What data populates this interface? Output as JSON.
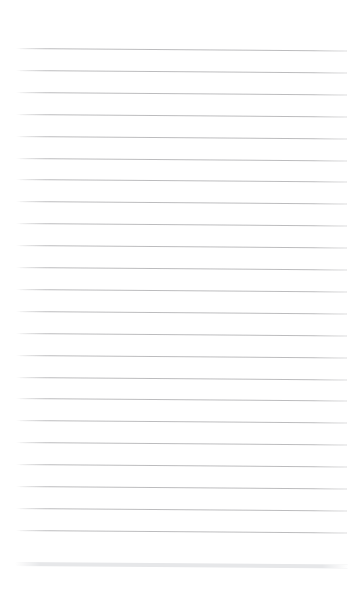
{
  "document": {
    "kind": "lined-paper",
    "title": "Lined Paper Sheet",
    "page_width": 362,
    "page_height": 590,
    "background_color": "#ffffff",
    "content_text": "",
    "is_blank": true
  },
  "layout": {
    "left_margin_x": 16,
    "right_margin_x": 347,
    "line_length": 331,
    "top_margin_height": 48,
    "bottom_margin_height": 22,
    "skew_degrees": 0.42
  },
  "rules": {
    "count": 23,
    "color": "#b9b9bb",
    "thickness": 1,
    "first_line_y": 48,
    "spacing": 21.9,
    "y_positions": [
      48.0,
      69.9,
      91.8,
      113.7,
      135.6,
      157.5,
      179.4,
      201.3,
      223.2,
      245.1,
      267.0,
      288.9,
      310.8,
      332.7,
      354.6,
      376.5,
      398.4,
      420.3,
      442.2,
      464.1,
      486.0,
      507.9,
      529.8
    ]
  },
  "footer_rule": {
    "label": "footer-rule",
    "color": "#e6e7e9",
    "thickness": 4,
    "y": 562,
    "left_x": 15,
    "right_x": 348
  },
  "write_zones": {
    "count": 23,
    "placeholder": ""
  }
}
